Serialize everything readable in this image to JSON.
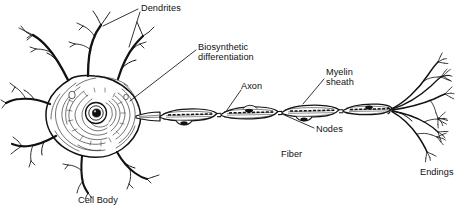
{
  "figure": {
    "kind": "neuron-anatomy-illustration",
    "style": "black ink line engraving on white",
    "background_color": "#ffffff",
    "ink_color": "#121212",
    "width": 469,
    "height": 221
  },
  "labels": {
    "dendrites": "Dendrites",
    "biosynthetic_line1": "Biosynthetic",
    "biosynthetic_line2": "differentiation",
    "axon": "Axon",
    "myelin_line1": "Myelin",
    "myelin_line2": "sheath",
    "nodes": "Nodes",
    "fiber": "Fiber",
    "cell_body": "Cell Body",
    "endings": "Endings"
  },
  "parts": [
    {
      "name": "cell-body",
      "label": "Cell Body",
      "has_leader": false
    },
    {
      "name": "dendrites",
      "label": "Dendrites",
      "has_leader": true
    },
    {
      "name": "biosynthetic-differentiation",
      "label": "Biosynthetic differentiation",
      "has_leader": true
    },
    {
      "name": "axon",
      "label": "Axon",
      "has_leader": true
    },
    {
      "name": "myelin-sheath",
      "label": "Myelin sheath",
      "has_leader": true
    },
    {
      "name": "nodes",
      "label": "Nodes",
      "has_leader": true
    },
    {
      "name": "fiber",
      "label": "Fiber",
      "has_leader": false
    },
    {
      "name": "endings",
      "label": "Endings",
      "has_leader": false
    }
  ]
}
